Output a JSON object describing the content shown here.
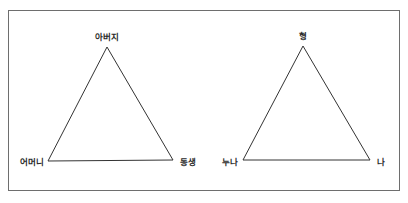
{
  "diagram": {
    "type": "family-relationship-triangles",
    "colors": {
      "line": "#333333",
      "frame": "#6e6e6e",
      "text": "#2a2a2a",
      "background": "#ffffff"
    },
    "triangles": [
      {
        "id": "left",
        "top": {
          "label": "아버지",
          "x": 107,
          "y": 47
        },
        "bottom_left": {
          "label": "어머니",
          "x": 48,
          "y": 161
        },
        "bottom_right": {
          "label": "동생",
          "x": 173,
          "y": 160
        }
      },
      {
        "id": "right",
        "top": {
          "label": "형",
          "x": 303,
          "y": 46
        },
        "bottom_left": {
          "label": "누나",
          "x": 243,
          "y": 160
        },
        "bottom_right": {
          "label": "나",
          "x": 370,
          "y": 160
        }
      }
    ]
  }
}
